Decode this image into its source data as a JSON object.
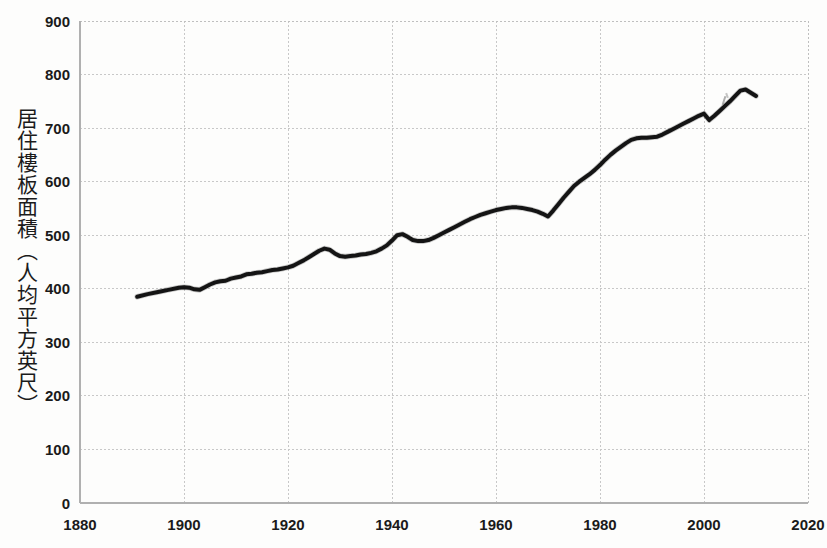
{
  "chart_data": {
    "type": "line",
    "title": "",
    "xlabel": "",
    "ylabel": "居住樓板面積（人均平方英尺）",
    "xlim": [
      1880,
      2020
    ],
    "ylim": [
      0,
      900
    ],
    "xticks": [
      "1880",
      "1900",
      "1920",
      "1940",
      "1960",
      "1980",
      "2000",
      "2020"
    ],
    "yticks": [
      "0",
      "100",
      "200",
      "300",
      "400",
      "500",
      "600",
      "700",
      "800",
      "900"
    ],
    "grid": true,
    "legend": "none",
    "series": [
      {
        "name": "居住樓板面積",
        "color": "#141414",
        "x": [
          1891,
          1893,
          1895,
          1897,
          1899,
          1900,
          1901,
          1902,
          1903,
          1904,
          1905,
          1906,
          1907,
          1908,
          1909,
          1910,
          1911,
          1912,
          1913,
          1914,
          1915,
          1916,
          1917,
          1918,
          1919,
          1920,
          1921,
          1922,
          1923,
          1924,
          1925,
          1926,
          1927,
          1928,
          1929,
          1930,
          1931,
          1932,
          1933,
          1934,
          1935,
          1936,
          1937,
          1938,
          1939,
          1940,
          1941,
          1942,
          1943,
          1944,
          1945,
          1946,
          1947,
          1948,
          1949,
          1950,
          1951,
          1952,
          1953,
          1954,
          1955,
          1956,
          1957,
          1958,
          1959,
          1960,
          1961,
          1962,
          1963,
          1964,
          1965,
          1966,
          1967,
          1968,
          1969,
          1970,
          1971,
          1972,
          1973,
          1974,
          1975,
          1976,
          1977,
          1978,
          1979,
          1980,
          1981,
          1982,
          1983,
          1984,
          1985,
          1986,
          1987,
          1988,
          1989,
          1990,
          1991,
          1992,
          1993,
          1994,
          1995,
          1996,
          1997,
          1998,
          1999,
          2000,
          2001,
          2002,
          2003,
          2004,
          2005,
          2006,
          2007,
          2008,
          2009,
          2010
        ],
        "y": [
          385,
          390,
          394,
          398,
          402,
          403,
          402,
          399,
          398,
          403,
          408,
          412,
          414,
          415,
          419,
          421,
          423,
          427,
          428,
          430,
          431,
          433,
          435,
          436,
          438,
          440,
          443,
          448,
          453,
          459,
          465,
          471,
          475,
          473,
          466,
          461,
          460,
          461,
          462,
          464,
          465,
          467,
          470,
          475,
          481,
          490,
          500,
          502,
          497,
          491,
          489,
          489,
          491,
          495,
          500,
          505,
          510,
          515,
          520,
          525,
          530,
          534,
          538,
          541,
          544,
          547,
          549,
          551,
          552,
          552,
          551,
          549,
          547,
          544,
          540,
          535,
          546,
          558,
          570,
          581,
          592,
          600,
          607,
          614,
          622,
          631,
          641,
          650,
          658,
          665,
          672,
          678,
          681,
          682,
          682,
          683,
          684,
          688,
          693,
          698,
          703,
          708,
          713,
          718,
          723,
          727,
          715,
          723,
          732,
          741,
          750,
          760,
          770,
          772,
          766,
          760
        ]
      }
    ]
  },
  "axis": {
    "y_label_text": "居住樓板面積（人均平方英尺）",
    "y_tick_labels": [
      "900",
      "800",
      "700",
      "600",
      "500",
      "400",
      "300",
      "200",
      "100",
      "0"
    ],
    "x_tick_labels": [
      "1880",
      "1900",
      "1920",
      "1940",
      "1960",
      "1980",
      "2000",
      "2020"
    ]
  },
  "colors": {
    "line": "#141414",
    "grid": "#c8c8c8",
    "plot_border": "#bfbfbf",
    "text": "#1a1a1a",
    "background": "#fdfdfc"
  }
}
